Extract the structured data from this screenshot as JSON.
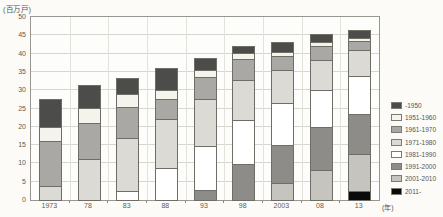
{
  "chart": {
    "unit_label": "(百万戸)",
    "year_suffix_label": "(年)"
  },
  "chart_data": {
    "type": "bar",
    "stacked": true,
    "title": "",
    "ylabel": "(百万戸)",
    "xlabel": "(年)",
    "ylim": [
      0,
      50
    ],
    "ytick_step": 5,
    "yticks": [
      0,
      5,
      10,
      15,
      20,
      25,
      30,
      35,
      40,
      45,
      50
    ],
    "grid": true,
    "legend_position": "right",
    "categories": [
      "1973",
      "78",
      "83",
      "88",
      "93",
      "98",
      "2003",
      "08",
      "13"
    ],
    "stack_order": "bottom_is_newest_period_top_is_oldest",
    "series": [
      {
        "name": "-1950",
        "color": "#4c4c4a",
        "values": [
          7.8,
          6.5,
          4.5,
          6.2,
          3.5,
          2.1,
          3.1,
          2.5,
          2.6
        ]
      },
      {
        "name": "1951-1960",
        "color": "#f4f3ec",
        "values": [
          4.3,
          4.2,
          3.9,
          2.7,
          2.3,
          2.1,
          1.4,
          1.2,
          0.9
        ]
      },
      {
        "name": "1961-1970",
        "color": "#a9a8a4",
        "values": [
          12.5,
          10.1,
          8.7,
          5.8,
          6.3,
          5.9,
          3.9,
          4.2,
          2.9
        ]
      },
      {
        "name": "1971-1980",
        "color": "#dbdad4",
        "values": [
          4.1,
          11.6,
          15.0,
          13.6,
          13.1,
          11.2,
          9.4,
          8.4,
          7.2
        ]
      },
      {
        "name": "1981-1990",
        "color": "#ffffff",
        "values": [
          0,
          0,
          2.6,
          9.1,
          12.2,
          12.4,
          11.7,
          10.3,
          10.7
        ]
      },
      {
        "name": "1991-2000",
        "color": "#8d8c88",
        "values": [
          0,
          0,
          0,
          0,
          3.0,
          10.0,
          10.7,
          12.0,
          11.3
        ]
      },
      {
        "name": "2001-2010",
        "color": "#c5c4bf",
        "values": [
          0,
          0,
          0,
          0,
          0,
          0,
          4.9,
          8.6,
          10.4
        ]
      },
      {
        "name": "2011-",
        "color": "#0a0a0a",
        "values": [
          0,
          0,
          0,
          0,
          0,
          0,
          0,
          0,
          2.7
        ]
      }
    ],
    "totals": [
      28.7,
      32.4,
      34.7,
      37.4,
      40.4,
      43.7,
      45.1,
      47.2,
      48.7
    ]
  }
}
